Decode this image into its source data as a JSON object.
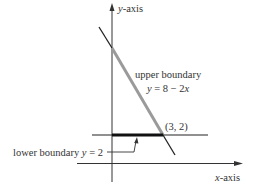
{
  "diagram": {
    "axes": {
      "y_label": "y-axis",
      "x_label": "x-axis",
      "y_label_var": "y",
      "y_label_rest": "-axis",
      "x_label_var": "x",
      "x_label_rest": "-axis"
    },
    "upper_boundary": {
      "label": "upper boundary",
      "equation_var": "y",
      "equation_mid": " = 8 − 2",
      "equation_x": "x",
      "equation": "y = 8 − 2x"
    },
    "lower_boundary": {
      "label_text": "lower boundary ",
      "label_var": "y",
      "label_rest": " = 2",
      "equation": "y = 2"
    },
    "intersection": {
      "label": "(3, 2)"
    },
    "colors": {
      "axis": "#333333",
      "line": "#222222",
      "highlight": "#9a9a9a",
      "text": "#333333"
    }
  }
}
